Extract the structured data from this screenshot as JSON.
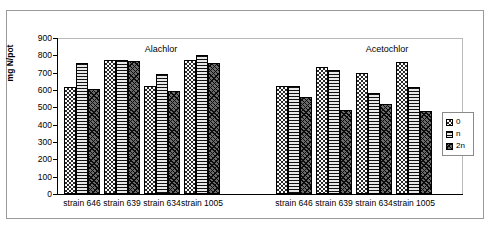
{
  "chart_data": {
    "type": "bar",
    "title": "",
    "xlabel": "",
    "ylabel": "mg N/pot",
    "ylim": [
      0,
      900
    ],
    "ytick_step": 100,
    "yticks": [
      "900",
      "800",
      "700",
      "600",
      "500",
      "400",
      "300",
      "200",
      "100",
      "0"
    ],
    "grid": false,
    "legend_position": "right",
    "legend": [
      "0",
      "n",
      "2n"
    ],
    "panels": [
      {
        "title": "Alachlor",
        "categories": [
          "strain 646",
          "strain 639",
          "strain 634",
          "strain 1005"
        ],
        "series": [
          {
            "name": "0",
            "values": [
              615,
              775,
              625,
              775
            ]
          },
          {
            "name": "n",
            "values": [
              755,
              775,
              695,
              800
            ]
          },
          {
            "name": "2n",
            "values": [
              605,
              770,
              595,
              755
            ]
          }
        ]
      },
      {
        "title": "Acetochlor",
        "categories": [
          "strain 646",
          "strain 639",
          "strain 634",
          "strain 1005"
        ],
        "series": [
          {
            "name": "0",
            "values": [
              625,
              735,
              700,
              760
            ]
          },
          {
            "name": "n",
            "values": [
              625,
              715,
              580,
              620
            ]
          },
          {
            "name": "2n",
            "values": [
              560,
              485,
              520,
              480
            ]
          }
        ]
      }
    ]
  }
}
